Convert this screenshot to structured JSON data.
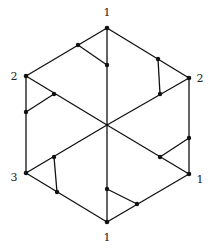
{
  "diagram": {
    "type": "hexagonal graph",
    "colors": {
      "line": "#111111",
      "background": "#ffffff"
    },
    "outer_vertices": [
      {
        "id": "top",
        "x": 107,
        "y": 28,
        "label": "1",
        "lx": 107,
        "ly": 16
      },
      {
        "id": "upper_left",
        "x": 26,
        "y": 76,
        "label": "2",
        "lx": 14,
        "ly": 80
      },
      {
        "id": "upper_right",
        "x": 189,
        "y": 78,
        "label": "2",
        "lx": 200,
        "ly": 82
      },
      {
        "id": "lower_left",
        "x": 26,
        "y": 173,
        "label": "3",
        "lx": 14,
        "ly": 181
      },
      {
        "id": "lower_right",
        "x": 189,
        "y": 174,
        "label": "1",
        "lx": 200,
        "ly": 183
      },
      {
        "id": "bottom",
        "x": 107,
        "y": 222,
        "label": "1",
        "lx": 107,
        "ly": 241
      }
    ],
    "center": {
      "x": 107,
      "y": 125
    },
    "inner_nodes": [
      {
        "id": "a1",
        "x": 78,
        "y": 45
      },
      {
        "id": "a2",
        "x": 107,
        "y": 65
      },
      {
        "id": "b1",
        "x": 158,
        "y": 59
      },
      {
        "id": "b2",
        "x": 160,
        "y": 94
      },
      {
        "id": "c1",
        "x": 54,
        "y": 94
      },
      {
        "id": "c2",
        "x": 26,
        "y": 112
      },
      {
        "id": "d1",
        "x": 54,
        "y": 157
      },
      {
        "id": "d2",
        "x": 57,
        "y": 192
      },
      {
        "id": "e1",
        "x": 160,
        "y": 157
      },
      {
        "id": "e2",
        "x": 189,
        "y": 138
      },
      {
        "id": "f1",
        "x": 107,
        "y": 189
      },
      {
        "id": "f2",
        "x": 137,
        "y": 204
      }
    ],
    "labels": [
      "1",
      "2",
      "2",
      "3",
      "1",
      "1"
    ]
  }
}
